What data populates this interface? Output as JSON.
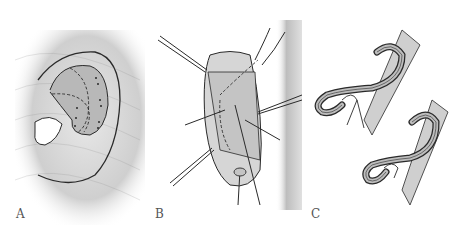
{
  "figure": {
    "panels": [
      {
        "id": "A",
        "label": "A",
        "description": "Ear with dashed incision lines and dot markings on concha/antihelix"
      },
      {
        "id": "B",
        "label": "B",
        "description": "Retracted ear with sutures and instruments, dashed cartilage outline"
      },
      {
        "id": "C",
        "label": "C",
        "description": "Two cross-sectional views of folded ear cartilage with sutures"
      }
    ],
    "colors": {
      "line": "#2a2a2a",
      "shade": "#b8b8b8",
      "skin_shadow": "#d9d9d9",
      "label": "#555555"
    }
  }
}
